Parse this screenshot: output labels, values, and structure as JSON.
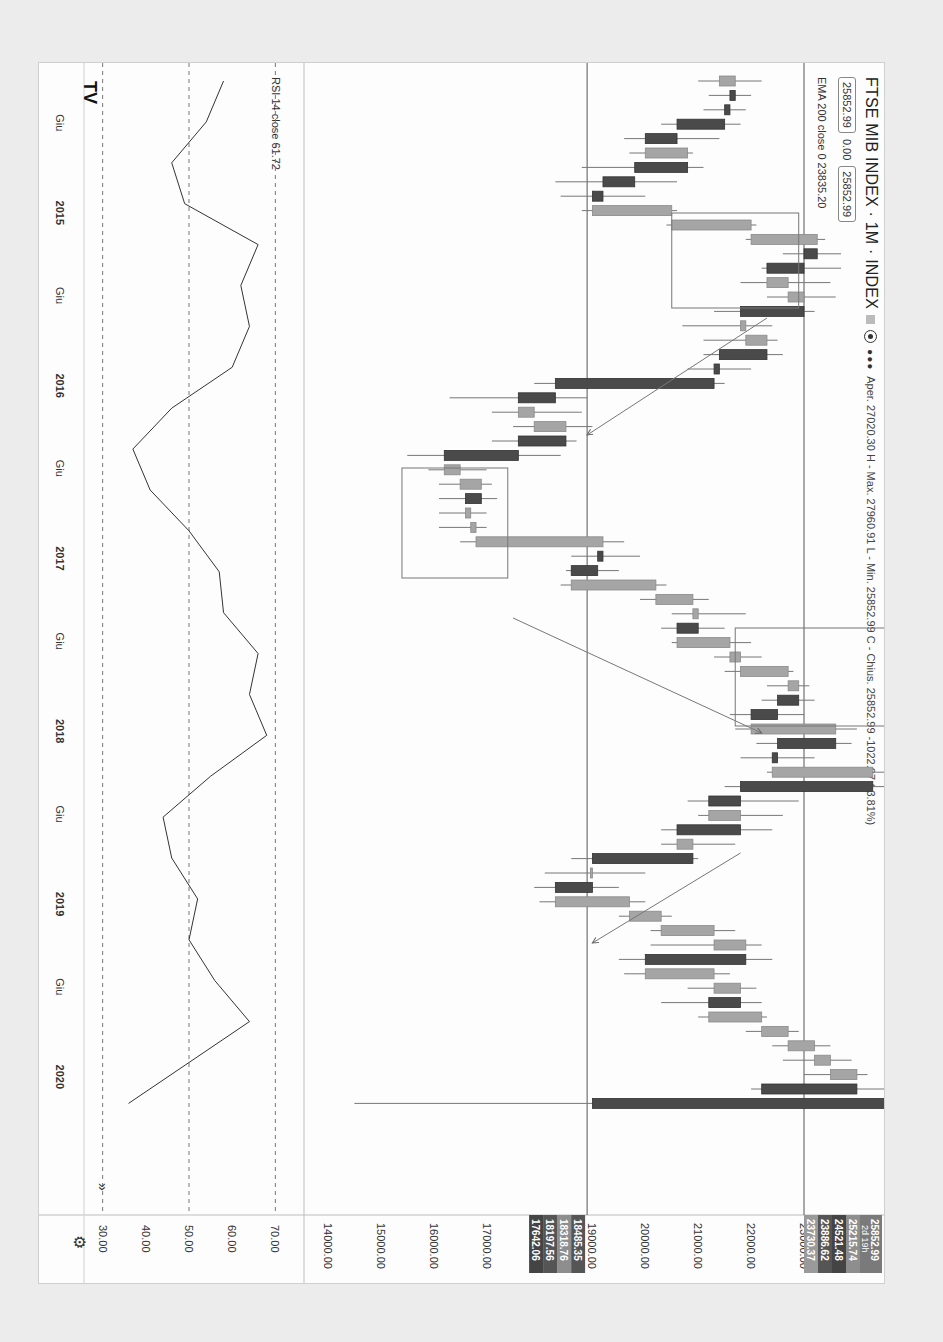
{
  "header": {
    "symbol": "FTSE MIB INDEX · 1M · INDEX",
    "ohlc": "Aper. 27020.30 H - Max. 27960.91 L - Min. 25852.99 C - Chius. 25852.99 -1022.97 (-3.81%)",
    "bid": "25852.99",
    "spread": "0.00",
    "ask": "25852.99",
    "eye_icon": "eye-icon",
    "more_icon": "more-dots-icon"
  },
  "indicators": {
    "ema_label": "EMA 200 close 0  23835.20",
    "rsi_label": "RSI 14 close  61.72"
  },
  "toolbar": {
    "currency": "EUR",
    "symbol_tag": "FTSEMIB",
    "fullscreen_icon": "fullscreen-icon",
    "arrow_icon": "arrow-down-icon",
    "settings_icon": "gear-icon",
    "scroll_right_icon": "double-chevron-right-icon",
    "logo": "TV"
  },
  "price_tags": [
    {
      "value": "25852.99",
      "sub": "2d 19h",
      "color": "#7a7a7a"
    },
    {
      "value": "25215.74",
      "color": "#8e8e8e"
    },
    {
      "value": "24521.48",
      "color": "#444444"
    },
    {
      "value": "23886.62",
      "color": "#555555"
    },
    {
      "value": "23730.37",
      "color": "#9a9a9a"
    },
    {
      "value": "18485.35",
      "color": "#555555"
    },
    {
      "value": "18318.76",
      "color": "#8e8e8e"
    },
    {
      "value": "18197.56",
      "color": "#555555"
    },
    {
      "value": "17642.06",
      "color": "#444444"
    }
  ],
  "chart_data": [
    {
      "type": "candlestick",
      "title": "FTSE MIB INDEX · 1M · INDEX",
      "xlabel": "",
      "ylabel": "",
      "ylim": [
        13500,
        26500
      ],
      "y_ticks": [
        14000,
        15000,
        16000,
        17000,
        19000,
        20000,
        21000,
        22000,
        23000
      ],
      "x_ticks": [
        "Giu",
        "2015",
        "Giu",
        "2016",
        "Giu",
        "2017",
        "Giu",
        "2018",
        "Giu",
        "2019",
        "Giu",
        "2020"
      ],
      "grid": false,
      "horizontal_lines": [
        23000,
        18900
      ],
      "note": "monthly OHLC approx, Jan 2014 - Mar 2020",
      "months": [
        "2014-04",
        "2014-05",
        "2014-06",
        "2014-07",
        "2014-08",
        "2014-09",
        "2014-10",
        "2014-11",
        "2014-12",
        "2015-01",
        "2015-02",
        "2015-03",
        "2015-04",
        "2015-05",
        "2015-06",
        "2015-07",
        "2015-08",
        "2015-09",
        "2015-10",
        "2015-11",
        "2015-12",
        "2016-01",
        "2016-02",
        "2016-03",
        "2016-04",
        "2016-05",
        "2016-06",
        "2016-07",
        "2016-08",
        "2016-09",
        "2016-10",
        "2016-11",
        "2016-12",
        "2017-01",
        "2017-02",
        "2017-03",
        "2017-04",
        "2017-05",
        "2017-06",
        "2017-07",
        "2017-08",
        "2017-09",
        "2017-10",
        "2017-11",
        "2017-12",
        "2018-01",
        "2018-02",
        "2018-03",
        "2018-04",
        "2018-05",
        "2018-06",
        "2018-07",
        "2018-08",
        "2018-09",
        "2018-10",
        "2018-11",
        "2018-12",
        "2019-01",
        "2019-02",
        "2019-03",
        "2019-04",
        "2019-05",
        "2019-06",
        "2019-07",
        "2019-08",
        "2019-09",
        "2019-10",
        "2019-11",
        "2019-12",
        "2020-01",
        "2020-02",
        "2020-03"
      ],
      "open": [
        21400,
        21700,
        21600,
        21500,
        20600,
        20000,
        20800,
        19800,
        19200,
        19000,
        20500,
        22000,
        23250,
        23000,
        22300,
        22700,
        23000,
        21800,
        21900,
        22300,
        21400,
        21300,
        18300,
        17600,
        17900,
        18500,
        17600,
        16200,
        16500,
        16900,
        16600,
        16700,
        16800,
        19200,
        19100,
        18600,
        20200,
        20900,
        21000,
        20600,
        21600,
        21800,
        22700,
        22900,
        22500,
        22000,
        23600,
        22500,
        22400,
        24300,
        21800,
        21200,
        21800,
        20600,
        20900,
        19000,
        19000,
        18300,
        19700,
        20300,
        21300,
        21900,
        20000,
        21300,
        21800,
        21200,
        22200,
        22700,
        23200,
        23500,
        24000,
        25400
      ],
      "close": [
        21700,
        21600,
        21500,
        20600,
        20000,
        20800,
        19800,
        19200,
        19000,
        20500,
        22000,
        23250,
        23000,
        22300,
        22700,
        23000,
        21800,
        21900,
        22300,
        21400,
        21300,
        18300,
        17600,
        17900,
        18500,
        17600,
        16200,
        16500,
        16900,
        16600,
        16700,
        16800,
        19200,
        19100,
        18600,
        20200,
        20900,
        21000,
        20600,
        21600,
        21800,
        22700,
        22900,
        22500,
        22000,
        23600,
        22500,
        22400,
        24300,
        21800,
        21200,
        21800,
        20600,
        20900,
        19000,
        19000,
        18300,
        19700,
        20300,
        21300,
        21900,
        20000,
        21300,
        21800,
        21200,
        22200,
        22700,
        23200,
        23500,
        24000,
        22200,
        19000
      ],
      "high": [
        22200,
        22000,
        21900,
        21800,
        21400,
        20900,
        21100,
        20600,
        20000,
        20600,
        22100,
        23400,
        23700,
        23700,
        23500,
        23600,
        23200,
        22400,
        22500,
        22600,
        22000,
        21500,
        18900,
        18800,
        19000,
        18700,
        18400,
        17000,
        17100,
        17200,
        17000,
        17000,
        19600,
        19900,
        19500,
        20400,
        21200,
        21900,
        21500,
        22000,
        22200,
        22800,
        23100,
        23200,
        23000,
        24000,
        23900,
        23200,
        24600,
        24600,
        22900,
        22600,
        22400,
        21700,
        21000,
        20000,
        19500,
        20000,
        20500,
        21700,
        22200,
        22400,
        21600,
        22100,
        22200,
        22300,
        22900,
        23500,
        23900,
        24200,
        25500,
        27600
      ],
      "low": [
        21000,
        21200,
        21100,
        20300,
        19600,
        19700,
        18800,
        18300,
        18400,
        18800,
        20400,
        21900,
        22600,
        22200,
        21800,
        22300,
        21300,
        20700,
        21100,
        21100,
        20800,
        17900,
        16300,
        17100,
        17500,
        17100,
        15500,
        15900,
        16100,
        16100,
        16100,
        16100,
        16500,
        18600,
        18500,
        18400,
        19900,
        20500,
        20300,
        20500,
        21300,
        21500,
        22300,
        22200,
        21600,
        21700,
        22100,
        21800,
        22300,
        21500,
        20800,
        21000,
        20300,
        20300,
        18600,
        18100,
        17900,
        18000,
        19500,
        20100,
        20100,
        19500,
        19600,
        20800,
        20300,
        21000,
        21900,
        22400,
        22600,
        23000,
        22000,
        14500
      ]
    },
    {
      "type": "line",
      "title": "RSI 14 close",
      "last_value": 61.72,
      "ylim": [
        28,
        72
      ],
      "y_ticks": [
        30,
        40,
        50,
        60,
        70
      ],
      "dashed_levels": [
        70,
        50,
        30
      ],
      "x": [
        "2014-04",
        "2014-07",
        "2014-10",
        "2015-01",
        "2015-04",
        "2015-07",
        "2015-10",
        "2016-01",
        "2016-04",
        "2016-07",
        "2016-10",
        "2017-01",
        "2017-04",
        "2017-07",
        "2017-10",
        "2018-01",
        "2018-04",
        "2018-07",
        "2018-10",
        "2019-01",
        "2019-04",
        "2019-07",
        "2019-10",
        "2020-01",
        "2020-02",
        "2020-03"
      ],
      "values": [
        58,
        54,
        46,
        49,
        66,
        62,
        64,
        60,
        46,
        37,
        41,
        50,
        57,
        58,
        66,
        64,
        68,
        55,
        44,
        46,
        52,
        50,
        56,
        64,
        50,
        36
      ]
    }
  ]
}
